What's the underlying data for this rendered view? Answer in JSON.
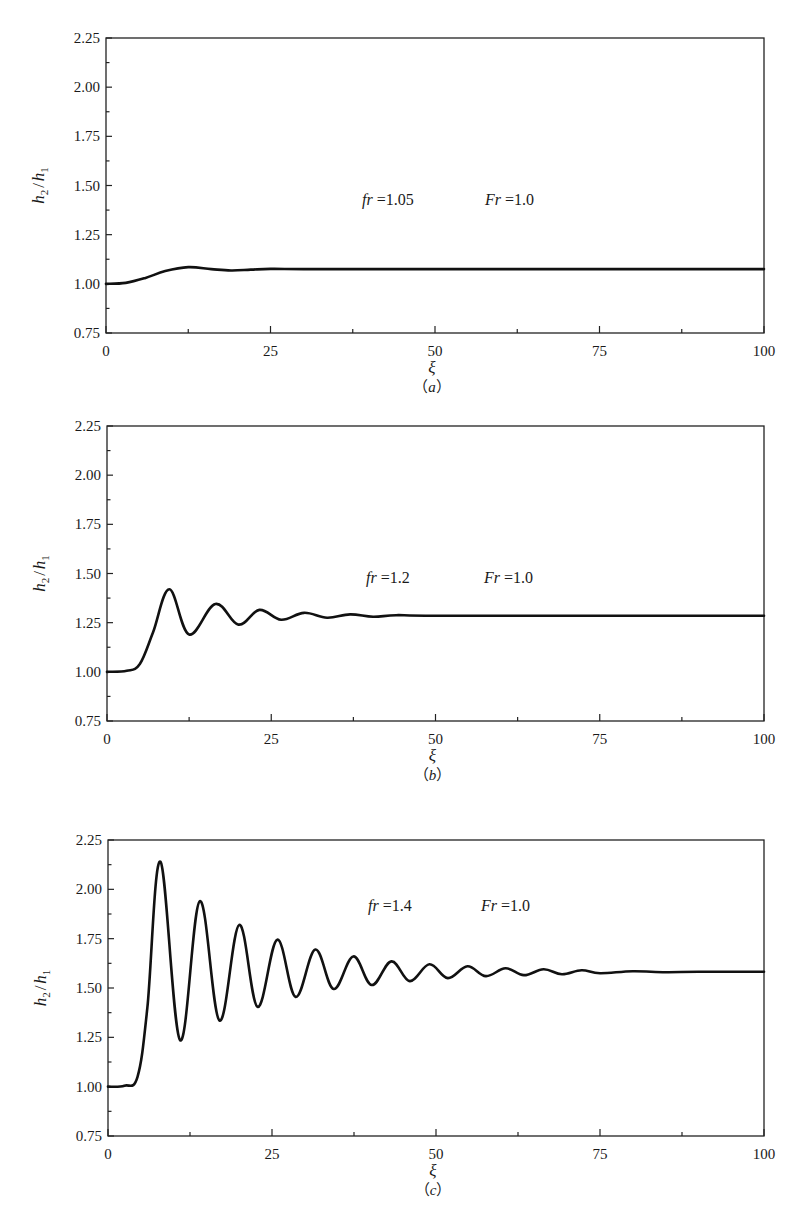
{
  "figure": {
    "panels": [
      {
        "caption_paren_open": "（",
        "caption_letter": "a",
        "caption_paren_close": "）",
        "annotation": {
          "fr_label": "fr",
          "fr_value": " =1.05",
          "Fr_label": "Fr",
          "Fr_value": " =1.0"
        }
      },
      {
        "caption_paren_open": "（",
        "caption_letter": "b",
        "caption_paren_close": "）",
        "annotation": {
          "fr_label": "fr",
          "fr_value": " =1.2",
          "Fr_label": "Fr",
          "Fr_value": " =1.0"
        }
      },
      {
        "caption_paren_open": "（",
        "caption_letter": "c",
        "caption_paren_close": "）",
        "annotation": {
          "fr_label": "fr",
          "fr_value": " =1.4",
          "Fr_label": "Fr",
          "Fr_value": " =1.0"
        }
      }
    ],
    "y_axis_label_h2": "h",
    "y_axis_label_sub2": "2",
    "y_axis_label_slash": "/",
    "y_axis_label_h1": "h",
    "y_axis_label_sub1": "1",
    "x_axis_label": "ξ",
    "x_ticks": [
      "0",
      "25",
      "50",
      "75",
      "100"
    ],
    "y_ticks": [
      "0.75",
      "1.00",
      "1.25",
      "1.50",
      "1.75",
      "2.00",
      "2.25"
    ]
  },
  "chart_data": [
    {
      "type": "line",
      "title": "(a) fr=1.05, Fr=1.0",
      "xlabel": "ξ",
      "ylabel": "h2/h1",
      "xlim": [
        0,
        100
      ],
      "ylim": [
        0.75,
        2.25
      ],
      "xticks": [
        0,
        25,
        50,
        75,
        100
      ],
      "yticks": [
        0.75,
        1.0,
        1.25,
        1.5,
        1.75,
        2.0,
        2.25
      ],
      "grid": false,
      "annotations": [
        "fr =1.05",
        "Fr =1.0"
      ],
      "series": [
        {
          "name": "fr=1.05",
          "x": [
            0,
            3,
            6,
            9,
            12.5,
            16,
            19,
            22,
            25,
            30,
            40,
            50,
            75,
            100
          ],
          "y": [
            1.0,
            1.005,
            1.03,
            1.065,
            1.085,
            1.075,
            1.068,
            1.072,
            1.076,
            1.075,
            1.075,
            1.075,
            1.075,
            1.075
          ]
        }
      ]
    },
    {
      "type": "line",
      "title": "(b) fr=1.2, Fr=1.0",
      "xlabel": "ξ",
      "ylabel": "h2/h1",
      "xlim": [
        0,
        100
      ],
      "ylim": [
        0.75,
        2.25
      ],
      "xticks": [
        0,
        25,
        50,
        75,
        100
      ],
      "yticks": [
        0.75,
        1.0,
        1.25,
        1.5,
        1.75,
        2.0,
        2.25
      ],
      "grid": false,
      "annotations": [
        "fr =1.2",
        "Fr =1.0"
      ],
      "series": [
        {
          "name": "fr=1.2",
          "x": [
            0,
            3,
            5,
            7,
            9.5,
            12.5,
            16.5,
            20,
            23.2,
            26.5,
            30,
            33.5,
            37,
            40.5,
            44,
            50,
            75,
            100
          ],
          "y": [
            1.0,
            1.005,
            1.04,
            1.2,
            1.42,
            1.19,
            1.345,
            1.24,
            1.315,
            1.265,
            1.3,
            1.275,
            1.292,
            1.28,
            1.288,
            1.285,
            1.285,
            1.285
          ]
        }
      ]
    },
    {
      "type": "line",
      "title": "(c) fr=1.4, Fr=1.0",
      "xlabel": "ξ",
      "ylabel": "h2/h1",
      "xlim": [
        0,
        100
      ],
      "ylim": [
        0.75,
        2.25
      ],
      "xticks": [
        0,
        25,
        50,
        75,
        100
      ],
      "yticks": [
        0.75,
        1.0,
        1.25,
        1.5,
        1.75,
        2.0,
        2.25
      ],
      "grid": false,
      "annotations": [
        "fr =1.4",
        "Fr =1.0"
      ],
      "series": [
        {
          "name": "fr=1.4",
          "x": [
            0,
            2.5,
            4.5,
            6,
            8,
            11,
            14,
            17,
            20,
            22.8,
            25.8,
            28.6,
            31.6,
            34.4,
            37.4,
            40.2,
            43.2,
            46,
            49,
            51.8,
            54.8,
            57.6,
            60.6,
            63.4,
            66.4,
            69.2,
            72.2,
            75,
            80,
            85,
            90,
            100
          ],
          "y": [
            1.0,
            1.005,
            1.05,
            1.4,
            2.14,
            1.235,
            1.94,
            1.335,
            1.82,
            1.405,
            1.745,
            1.455,
            1.695,
            1.495,
            1.66,
            1.515,
            1.635,
            1.535,
            1.62,
            1.55,
            1.61,
            1.56,
            1.6,
            1.565,
            1.595,
            1.57,
            1.59,
            1.575,
            1.585,
            1.58,
            1.582,
            1.582
          ]
        }
      ]
    }
  ]
}
